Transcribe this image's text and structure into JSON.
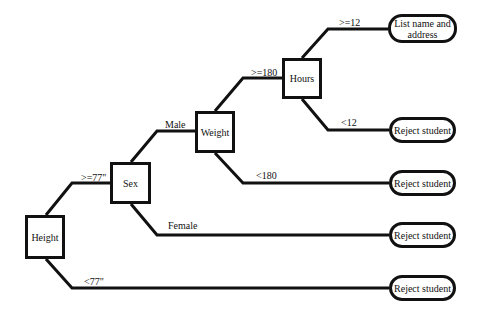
{
  "diagram": {
    "type": "decision-tree",
    "decisions": [
      {
        "id": "height",
        "label": "Height",
        "box": [
          25,
          215,
          40,
          44
        ]
      },
      {
        "id": "sex",
        "label": "Sex",
        "box": [
          110,
          162,
          41,
          42
        ]
      },
      {
        "id": "weight",
        "label": "Weight",
        "box": [
          195,
          111,
          40,
          42
        ]
      },
      {
        "id": "hours",
        "label": "Hours",
        "box": [
          282,
          58,
          40,
          41
        ]
      }
    ],
    "terminals": [
      {
        "id": "list",
        "label": "List name and address",
        "box": [
          388,
          14,
          69,
          29
        ]
      },
      {
        "id": "reject1",
        "label": "Reject student",
        "box": [
          389,
          117,
          67,
          26
        ]
      },
      {
        "id": "reject2",
        "label": "Reject student",
        "box": [
          389,
          170,
          67,
          26
        ]
      },
      {
        "id": "reject3",
        "label": "Reject student",
        "box": [
          389,
          222,
          67,
          26
        ]
      },
      {
        "id": "reject4",
        "label": "Reject student",
        "box": [
          389,
          275,
          67,
          26
        ]
      }
    ],
    "edges": [
      {
        "from": "height",
        "to": "sex",
        "label": ">=77\"",
        "points": "46,215 72,183 110,183",
        "label_pos": [
          81,
          172
        ]
      },
      {
        "from": "height",
        "to": "reject4",
        "label": "<77\"",
        "points": "46,259 72,288 389,288",
        "label_pos": [
          84,
          276
        ]
      },
      {
        "from": "sex",
        "to": "weight",
        "label": "Male",
        "points": "131,162 157,131 195,131",
        "label_pos": [
          165,
          119
        ]
      },
      {
        "from": "sex",
        "to": "reject3",
        "label": "Female",
        "points": "131,204 157,235 389,235",
        "label_pos": [
          168,
          220
        ]
      },
      {
        "from": "weight",
        "to": "hours",
        "label": ">=180",
        "points": "215,111 243,78 282,78",
        "label_pos": [
          251,
          67
        ]
      },
      {
        "from": "weight",
        "to": "reject2",
        "label": "<180",
        "points": "215,153 243,183 389,183",
        "label_pos": [
          256,
          170
        ]
      },
      {
        "from": "hours",
        "to": "list",
        "label": ">=12",
        "points": "302,58 328,29 388,29",
        "label_pos": [
          339,
          17
        ]
      },
      {
        "from": "hours",
        "to": "reject1",
        "label": "<12",
        "points": "302,99 328,130 389,130",
        "label_pos": [
          341,
          117
        ]
      }
    ]
  }
}
